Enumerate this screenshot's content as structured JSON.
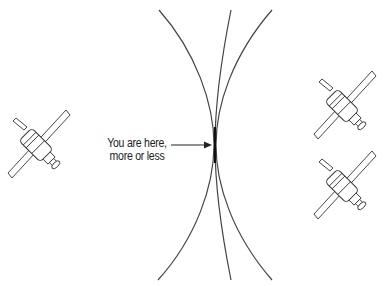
{
  "diagram": {
    "annotation": {
      "line1": "You are here,",
      "line2": "more or less"
    },
    "satellites": [
      {
        "name": "satellite-left",
        "x": 7,
        "y": 110
      },
      {
        "name": "satellite-right-top",
        "x": 313,
        "y": 71
      },
      {
        "name": "satellite-right-bottom",
        "x": 313,
        "y": 151
      }
    ],
    "colors": {
      "ink": "#222222",
      "curve": "#444444",
      "background": "#ffffff"
    }
  }
}
